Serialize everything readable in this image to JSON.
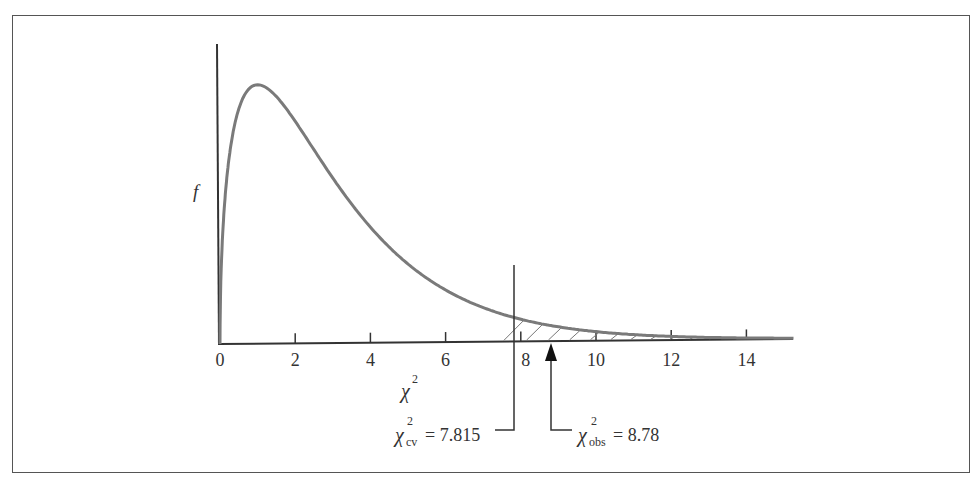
{
  "chart_data": {
    "type": "line",
    "title": "",
    "distribution": "chi-square",
    "df": 3,
    "xlabel": "χ²",
    "ylabel": "f",
    "xlim": [
      0,
      15.3
    ],
    "x_ticks": [
      0,
      2,
      4,
      6,
      8,
      10,
      12,
      14
    ],
    "x_tick_labels": [
      "0",
      "2",
      "4",
      "6",
      "8",
      "10",
      "12",
      "14"
    ],
    "grid": false,
    "legend": null,
    "series": [
      {
        "name": "chi-square pdf (df=3)",
        "x": [
          0.05,
          0.25,
          0.5,
          1.0,
          1.5,
          2,
          3,
          4,
          5,
          6,
          7,
          7.815,
          8,
          9,
          10,
          11,
          12,
          13,
          14,
          15
        ],
        "values": [
          0.087,
          0.193,
          0.22,
          0.242,
          0.231,
          0.208,
          0.154,
          0.108,
          0.073,
          0.049,
          0.032,
          0.022,
          0.021,
          0.013,
          0.008,
          0.005,
          0.003,
          0.002,
          0.001,
          0.001
        ]
      }
    ],
    "shaded_region": {
      "from": 7.815,
      "to": 15.3,
      "pattern": "hatched"
    },
    "annotations": [
      {
        "type": "vertical-line",
        "x": 7.815,
        "label": "χ²cv = 7.815",
        "symbol": "χ",
        "sup": "2",
        "sub": "cv",
        "value": "7.815"
      },
      {
        "type": "arrow",
        "x": 8.78,
        "label": "χ²obs = 8.78",
        "symbol": "χ",
        "sup": "2",
        "sub": "obs",
        "value": "8.78"
      }
    ]
  },
  "labels": {
    "y_axis": "f",
    "x_axis_symbol": "χ",
    "x_axis_sup": "2",
    "cv_symbol": "χ",
    "cv_sup": "2",
    "cv_sub": "cv",
    "cv_eq": "= 7.815",
    "obs_symbol": "χ",
    "obs_sup": "2",
    "obs_sub": "obs",
    "obs_eq": "= 8.78"
  },
  "colors": {
    "curve": "#7a7a7a",
    "axis": "#333333",
    "frame": "#555555"
  }
}
